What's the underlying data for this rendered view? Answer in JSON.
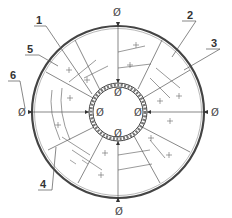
{
  "diagram": {
    "type": "technical-cross-section",
    "colors": {
      "line": "#555555",
      "outer_ring": "#444444",
      "label": "#333333",
      "background": "#ffffff"
    },
    "center": {
      "x": 118,
      "y": 112
    },
    "outer_radius": 85,
    "inner_radius": 28,
    "callouts": [
      {
        "id": "1",
        "text": "1",
        "x": 36,
        "y": 24
      },
      {
        "id": "2",
        "text": "2",
        "x": 187,
        "y": 19
      },
      {
        "id": "3",
        "text": "3",
        "x": 211,
        "y": 47
      },
      {
        "id": "4",
        "text": "4",
        "x": 40,
        "y": 188
      },
      {
        "id": "5",
        "text": "5",
        "x": 27,
        "y": 53
      },
      {
        "id": "6",
        "text": "6",
        "x": 10,
        "y": 79
      }
    ],
    "diameter_symbols": [
      {
        "id": "top-outer",
        "text": "Ø",
        "x": 118,
        "y": 13
      },
      {
        "id": "bottom-outer",
        "text": "Ø",
        "x": 121,
        "y": 214
      },
      {
        "id": "left-outer",
        "text": "Ø",
        "x": 25,
        "y": 116
      },
      {
        "id": "right-outer",
        "text": "Ø",
        "x": 216,
        "y": 116
      },
      {
        "id": "top-inner",
        "text": "Ø",
        "x": 118,
        "y": 97
      },
      {
        "id": "bottom-inner",
        "text": "Ø",
        "x": 119,
        "y": 133
      },
      {
        "id": "left-inner",
        "text": "Ø",
        "x": 101,
        "y": 116
      },
      {
        "id": "right-inner",
        "text": "Ø",
        "x": 139,
        "y": 116
      }
    ]
  }
}
